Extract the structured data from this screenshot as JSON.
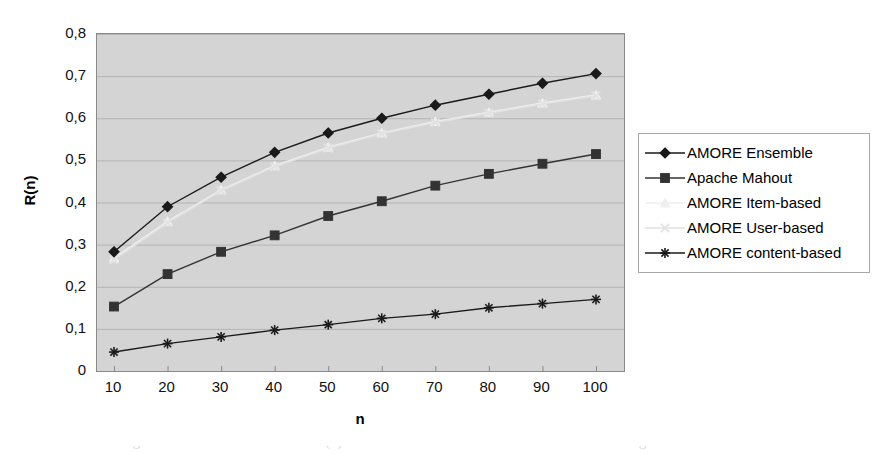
{
  "chart_data": {
    "type": "line",
    "title": "",
    "xlabel": "n",
    "ylabel": "R(n)",
    "x": [
      10,
      20,
      30,
      40,
      50,
      60,
      70,
      80,
      90,
      100
    ],
    "xtick_labels": [
      "10",
      "20",
      "30",
      "40",
      "50",
      "60",
      "70",
      "80",
      "90",
      "100"
    ],
    "ytick_labels": [
      "0",
      "0,1",
      "0,2",
      "0,3",
      "0,4",
      "0,5",
      "0,6",
      "0,7",
      "0,8"
    ],
    "ytick_values": [
      0,
      0.1,
      0.2,
      0.3,
      0.4,
      0.5,
      0.6,
      0.7,
      0.8
    ],
    "xlim": [
      10,
      100
    ],
    "ylim": [
      0,
      0.8
    ],
    "grid": "horizontal",
    "legend_position": "right",
    "plot_background": "#d4d4d4",
    "series": [
      {
        "name": "AMORE Ensemble",
        "marker": "diamond",
        "color": "#1a1a1a",
        "values": [
          0.283,
          0.39,
          0.46,
          0.519,
          0.565,
          0.6,
          0.631,
          0.657,
          0.683,
          0.706
        ]
      },
      {
        "name": "Apache Mahout",
        "marker": "square",
        "color": "#333333",
        "values": [
          0.153,
          0.23,
          0.283,
          0.322,
          0.368,
          0.403,
          0.44,
          0.468,
          0.492,
          0.515
        ]
      },
      {
        "name": "AMORE Item-based",
        "marker": "triangle",
        "color": "#efefef",
        "values": [
          0.268,
          0.355,
          0.43,
          0.487,
          0.531,
          0.565,
          0.592,
          0.614,
          0.636,
          0.655
        ]
      },
      {
        "name": "AMORE User-based",
        "marker": "x",
        "color": "#e2e2e2",
        "values": [
          0.264,
          0.352,
          0.428,
          0.485,
          0.529,
          0.563,
          0.59,
          0.612,
          0.634,
          0.653
        ]
      },
      {
        "name": "AMORE content-based",
        "marker": "asterisk",
        "color": "#1a1a1a",
        "values": [
          0.045,
          0.065,
          0.081,
          0.097,
          0.11,
          0.125,
          0.135,
          0.15,
          0.16,
          0.17
        ]
      }
    ]
  },
  "caption": {
    "text": "Figure 6.9 - The achieved recall R(n) as a function of n for various recommendation algorithms"
  }
}
